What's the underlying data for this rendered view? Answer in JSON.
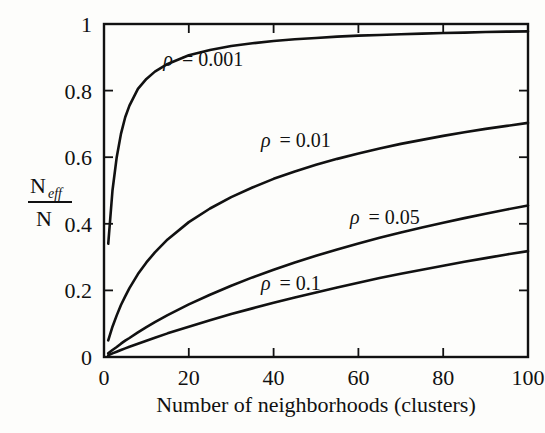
{
  "chart_data": {
    "type": "line",
    "title": "",
    "xlabel": "Number of neighborhoods (clusters)",
    "ylabel": "N_eff / N",
    "ylabel_numerator": "N",
    "ylabel_numerator_sub": "eff",
    "ylabel_denominator": "N",
    "xlim": [
      0,
      100
    ],
    "ylim": [
      0,
      1
    ],
    "xticks": [
      0,
      20,
      40,
      60,
      80,
      100
    ],
    "yticks": [
      0,
      0.2,
      0.4,
      0.6,
      0.8,
      1
    ],
    "xtick_labels": [
      "0",
      "20",
      "40",
      "60",
      "80",
      "100"
    ],
    "ytick_labels": [
      "0",
      "0.2",
      "0.4",
      "0.6",
      "0.8",
      "1"
    ],
    "grid": false,
    "legend": "inline-annotations",
    "line_color": "#111111",
    "background_color": "#fdfdfb",
    "x": [
      1,
      2,
      3,
      4,
      5,
      6,
      8,
      10,
      12,
      15,
      20,
      25,
      30,
      35,
      40,
      45,
      50,
      55,
      60,
      65,
      70,
      75,
      80,
      85,
      90,
      95,
      100
    ],
    "series": [
      {
        "name": "rho = 0.001",
        "label": "ρ = 0.001",
        "rho": 0.001,
        "values": [
          0.34,
          0.5,
          0.6,
          0.67,
          0.72,
          0.755,
          0.805,
          0.835,
          0.857,
          0.88,
          0.906,
          0.922,
          0.934,
          0.942,
          0.949,
          0.954,
          0.958,
          0.962,
          0.965,
          0.967,
          0.969,
          0.971,
          0.973,
          0.974,
          0.976,
          0.977,
          0.978
        ],
        "label_x": 14,
        "label_y": 0.875
      },
      {
        "name": "rho = 0.01",
        "label": "ρ = 0.01",
        "rho": 0.01,
        "values": [
          0.05,
          0.091,
          0.125,
          0.156,
          0.182,
          0.207,
          0.249,
          0.284,
          0.314,
          0.353,
          0.405,
          0.446,
          0.48,
          0.509,
          0.535,
          0.557,
          0.577,
          0.595,
          0.611,
          0.626,
          0.64,
          0.652,
          0.664,
          0.675,
          0.685,
          0.694,
          0.703
        ],
        "label_x": 37,
        "label_y": 0.63
      },
      {
        "name": "rho = 0.05",
        "label": "ρ = 0.05",
        "rho": 0.05,
        "values": [
          0.011,
          0.021,
          0.03,
          0.04,
          0.049,
          0.057,
          0.074,
          0.09,
          0.105,
          0.126,
          0.158,
          0.187,
          0.214,
          0.239,
          0.262,
          0.284,
          0.304,
          0.323,
          0.341,
          0.358,
          0.374,
          0.389,
          0.403,
          0.417,
          0.43,
          0.443,
          0.455
        ],
        "label_x": 58,
        "label_y": 0.4
      },
      {
        "name": "rho = 0.1",
        "label": "ρ = 0.1",
        "rho": 0.1,
        "values": [
          0.005,
          0.011,
          0.016,
          0.021,
          0.026,
          0.031,
          0.04,
          0.049,
          0.058,
          0.071,
          0.091,
          0.11,
          0.129,
          0.146,
          0.163,
          0.179,
          0.194,
          0.209,
          0.223,
          0.237,
          0.25,
          0.262,
          0.274,
          0.286,
          0.297,
          0.308,
          0.318
        ],
        "label_x": 37,
        "label_y": 0.2
      }
    ]
  },
  "figure": {
    "caption": "",
    "axis_label_x": "Number of neighborhoods (clusters)"
  }
}
